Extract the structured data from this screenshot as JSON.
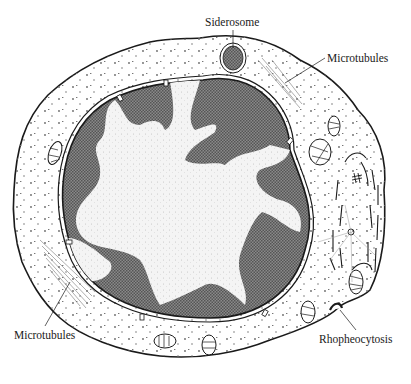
{
  "figure": {
    "labels": {
      "siderosome": "Siderosome",
      "microtubules_top": "Microtubules",
      "microtubules_left": "Microtubules",
      "rhopheocytosis": "Rhopheocytosis"
    },
    "structures": [
      "cell-membrane",
      "cytoplasm",
      "nuclear-envelope",
      "nuclear-pores",
      "heterochromatin",
      "euchromatin",
      "siderosome",
      "mitochondria",
      "golgi-apparatus",
      "centriole",
      "microtubules",
      "rhopheocytosis-pit"
    ],
    "colors": {
      "ink": "#1a1a1a",
      "heterochromatin": "#6e6e6e",
      "euchromatin": "#f4f4f4",
      "cytoplasm": "#ffffff"
    }
  }
}
